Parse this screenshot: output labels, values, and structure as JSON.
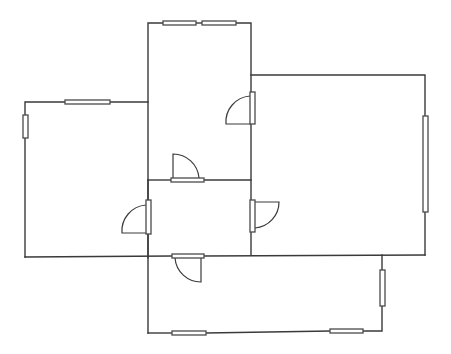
{
  "canvas": {
    "width": 451,
    "height": 354,
    "background": "#ffffff",
    "stroke": "#3a3a3a"
  },
  "walls": [
    {
      "id": "top-room-top-left",
      "points": [
        [
          148,
          258
        ],
        [
          148,
          23
        ],
        [
          163,
          23
        ]
      ]
    },
    {
      "id": "top-room-top-mid",
      "points": [
        [
          196,
          23
        ],
        [
          202,
          23
        ]
      ]
    },
    {
      "id": "top-room-top-right",
      "points": [
        [
          236,
          23
        ],
        [
          251,
          23
        ],
        [
          251,
          92
        ]
      ]
    },
    {
      "id": "center-wall-lower",
      "points": [
        [
          251,
          124
        ],
        [
          251,
          200
        ]
      ]
    },
    {
      "id": "center-wall-bottom",
      "points": [
        [
          251,
          232
        ],
        [
          251,
          255
        ]
      ]
    },
    {
      "id": "right-room-top",
      "points": [
        [
          251,
          75
        ],
        [
          425,
          75
        ],
        [
          425,
          116
        ]
      ]
    },
    {
      "id": "right-room-right-lower",
      "points": [
        [
          425,
          212
        ],
        [
          425,
          255
        ]
      ]
    },
    {
      "id": "left-room-top-a",
      "points": [
        [
          65,
          102
        ],
        [
          25,
          102
        ],
        [
          25,
          115
        ]
      ]
    },
    {
      "id": "left-room-top-b",
      "points": [
        [
          110,
          102
        ],
        [
          148,
          102
        ]
      ]
    },
    {
      "id": "left-room-left-lower",
      "points": [
        [
          25,
          138
        ],
        [
          25,
          257
        ]
      ]
    },
    {
      "id": "main-bottom-wall-a",
      "points": [
        [
          25,
          257
        ],
        [
          172,
          256
        ]
      ]
    },
    {
      "id": "main-bottom-wall-b",
      "points": [
        [
          204,
          256
        ],
        [
          425,
          255
        ]
      ]
    },
    {
      "id": "mid-horizontal-a",
      "points": [
        [
          148,
          180
        ],
        [
          171,
          180
        ]
      ]
    },
    {
      "id": "mid-horizontal-b",
      "points": [
        [
          204,
          180
        ],
        [
          251,
          180
        ]
      ]
    },
    {
      "id": "left-door-wall-upper",
      "points": [
        [
          148,
          180
        ],
        [
          148,
          200
        ]
      ]
    },
    {
      "id": "left-door-wall-lower",
      "points": [
        [
          148,
          234
        ],
        [
          148,
          333
        ]
      ]
    },
    {
      "id": "bottom-room-bottom-a",
      "points": [
        [
          148,
          333
        ],
        [
          172,
          333
        ]
      ]
    },
    {
      "id": "bottom-room-bottom-b",
      "points": [
        [
          206,
          333
        ],
        [
          330,
          331
        ]
      ]
    },
    {
      "id": "bottom-room-bottom-c",
      "points": [
        [
          363,
          331
        ],
        [
          382,
          331
        ],
        [
          382,
          306
        ]
      ]
    },
    {
      "id": "bottom-room-right-upper",
      "points": [
        [
          382,
          270
        ],
        [
          382,
          255
        ]
      ]
    }
  ],
  "windows": [
    {
      "id": "window-top-1",
      "x": 163,
      "y": 21,
      "w": 33,
      "h": 4
    },
    {
      "id": "window-top-2",
      "x": 202,
      "y": 21,
      "w": 34,
      "h": 4
    },
    {
      "id": "window-left-top",
      "x": 65,
      "y": 100,
      "w": 45,
      "h": 4
    },
    {
      "id": "window-left-side",
      "x": 23,
      "y": 115,
      "w": 5,
      "h": 23
    },
    {
      "id": "window-right-side",
      "x": 423,
      "y": 116,
      "w": 5,
      "h": 96
    },
    {
      "id": "window-bottom-right-side",
      "x": 380,
      "y": 270,
      "w": 5,
      "h": 36
    },
    {
      "id": "window-bottom-1",
      "x": 172,
      "y": 331,
      "w": 34,
      "h": 4
    },
    {
      "id": "window-bottom-2",
      "x": 330,
      "y": 329,
      "w": 33,
      "h": 4
    }
  ],
  "doors": [
    {
      "id": "door-top-room-right",
      "leaf": {
        "x": 250,
        "y": 92,
        "w": 5,
        "h": 32
      },
      "swing": "M250,124 L226,124 A26,26 0 0 1 250,96"
    },
    {
      "id": "door-mid-horizontal",
      "leaf": {
        "x": 171,
        "y": 178,
        "w": 33,
        "h": 4
      },
      "swing": "M173,178 L173,154 A26,26 0 0 1 199,178"
    },
    {
      "id": "door-left-vertical",
      "leaf": {
        "x": 146,
        "y": 200,
        "w": 5,
        "h": 34
      },
      "swing": "M146,233 L122,233 A26,26 0 0 1 146,205"
    },
    {
      "id": "door-center-right",
      "leaf": {
        "x": 250,
        "y": 200,
        "w": 5,
        "h": 32
      },
      "swing": "M255,202 L279,202 A26,26 0 0 1 255,228"
    },
    {
      "id": "door-bottom",
      "leaf": {
        "x": 172,
        "y": 254,
        "w": 32,
        "h": 4
      },
      "swing": "M175,258 A26,26 0 0 0 201,282 L201,258"
    }
  ]
}
